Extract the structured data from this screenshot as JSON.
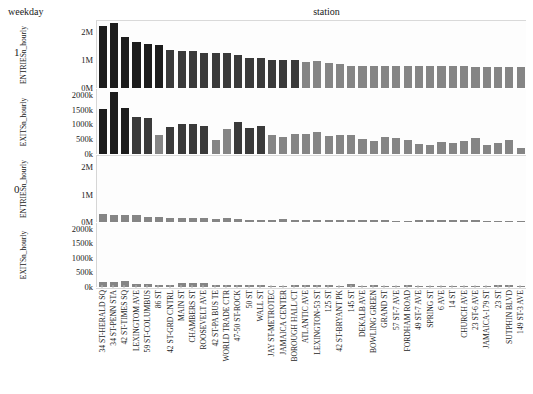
{
  "header": {
    "row_facet_label": "weekday",
    "column_facet_label": "station"
  },
  "rows": [
    {
      "label": "1"
    },
    {
      "label": "0"
    }
  ],
  "axes": {
    "entries_title": "ENTRIESn_hourly",
    "exits_title": "EXITSn_hourly",
    "entries_ticks": [
      "2M",
      "1M",
      "0M"
    ],
    "exits_ticks": [
      "2000k",
      "1500k",
      "1000k",
      "500k",
      "0k"
    ]
  },
  "chart_data": {
    "type": "bar",
    "title": "",
    "xlabel": "station",
    "ylabel": "",
    "grid": false,
    "legend": "none",
    "facet_row_variable": "weekday",
    "facet_row_values": [
      "1",
      "0"
    ],
    "categories": [
      "34 ST-HERALD SQ",
      "34 ST-PENN STA",
      "42 ST-TIMES SQ",
      "LEXINGTOM AVE",
      "59 ST-COLUMBUS",
      "86 ST",
      "42 ST-GRD CNTRL",
      "MAIN ST",
      "CHAMBERS ST",
      "ROOSEVELT AVE",
      "42 ST-PA BUS TE",
      "WORLD TRADE CTR",
      "47-50 ST-ROCK",
      "50 ST",
      "WALL ST",
      "JAY ST-METROTEC",
      "JAMAICA CENTER",
      "BOROUGH HALL/CT",
      "ATLANTIC AVE",
      "LEXINGTON-53 ST",
      "125 ST",
      "42 ST-BRYANT PK",
      "145 ST",
      "DEKALB AVE",
      "BOWLING GREEN",
      "GRAND ST",
      "57 ST-7 AVE",
      "FORDHAM ROAD",
      "49 ST-7 AVE",
      "SPRING ST",
      "6 AVE",
      "14 ST",
      "CHURCH AVE",
      "23 ST-6 AVE",
      "JAMAICA-179 ST",
      "23 ST",
      "SUTPHIN BLVD",
      "149 ST-3 AVE"
    ],
    "panels": [
      {
        "name": "ENTRIESn_hourly-weekday-1",
        "weekday": "1",
        "measure": "ENTRIESn_hourly",
        "ylim": [
          0,
          2400000
        ],
        "yticks": [
          0,
          1000000,
          2000000
        ],
        "ytick_labels": [
          "0M",
          "1M",
          "2M"
        ],
        "values": [
          2230000,
          2330000,
          1830000,
          1640000,
          1560000,
          1550000,
          1370000,
          1330000,
          1330000,
          1240000,
          1250000,
          1270000,
          1180000,
          1070000,
          1090000,
          1000000,
          1000000,
          1010000,
          930000,
          960000,
          880000,
          870000,
          790000,
          800000,
          790000,
          790000,
          790000,
          780000,
          780000,
          780000,
          780000,
          780000,
          780000,
          770000,
          770000,
          770000,
          760000,
          760000
        ]
      },
      {
        "name": "EXITSn_hourly-weekday-1",
        "weekday": "1",
        "measure": "EXITSn_hourly",
        "ylim": [
          0,
          2200000
        ],
        "yticks": [
          0,
          500000,
          1000000,
          1500000,
          2000000
        ],
        "ytick_labels": [
          "0k",
          "500k",
          "1000k",
          "1500k",
          "2000k"
        ],
        "values": [
          1530000,
          2100000,
          1550000,
          1260000,
          1230000,
          650000,
          900000,
          1000000,
          1030000,
          950000,
          470000,
          830000,
          1080000,
          890000,
          950000,
          640000,
          570000,
          670000,
          670000,
          740000,
          620000,
          660000,
          660000,
          520000,
          430000,
          560000,
          540000,
          480000,
          330000,
          290000,
          390000,
          380000,
          440000,
          550000,
          300000,
          360000,
          480000,
          220000
        ]
      },
      {
        "name": "ENTRIESn_hourly-weekday-0",
        "weekday": "0",
        "measure": "ENTRIESn_hourly",
        "ylim": [
          0,
          2400000
        ],
        "yticks": [
          0,
          1000000,
          2000000
        ],
        "ytick_labels": [
          "0M",
          "1M",
          "2M"
        ],
        "values": [
          290000,
          260000,
          250000,
          240000,
          180000,
          190000,
          160000,
          130000,
          150000,
          140000,
          100000,
          150000,
          110000,
          90000,
          80000,
          80000,
          95000,
          70000,
          70000,
          70000,
          70000,
          90000,
          70000,
          85000,
          60000,
          75000,
          55000,
          50000,
          75000,
          70000,
          70000,
          70000,
          70000,
          70000,
          55000,
          50000,
          50000,
          55000
        ]
      },
      {
        "name": "EXITSn_hourly-weekday-0",
        "weekday": "0",
        "measure": "EXITSn_hourly",
        "ylim": [
          0,
          2200000
        ],
        "yticks": [
          0,
          500000,
          1000000,
          1500000,
          2000000
        ],
        "ytick_labels": [
          "0k",
          "500k",
          "1000k",
          "1500k",
          "2000k"
        ],
        "values": [
          185000,
          175000,
          195000,
          110000,
          120000,
          60000,
          65000,
          135000,
          130000,
          145000,
          65000,
          60000,
          60000,
          55000,
          80000,
          45000,
          45000,
          60000,
          55000,
          55000,
          80000,
          45000,
          100000,
          50000,
          60000,
          45000,
          45000,
          65000,
          40000,
          40000,
          40000,
          45000,
          50000,
          45000,
          40000,
          55000,
          60000,
          35000
        ]
      }
    ],
    "colors": {
      "bar_dark": "#1c1c1c",
      "bar_mid": "#3a3a3a",
      "bar_light": "#858585",
      "background": "#fdfdfd",
      "axis": "#d6d6d6"
    }
  }
}
